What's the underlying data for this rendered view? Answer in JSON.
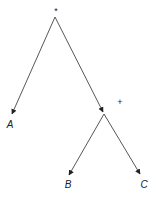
{
  "diagram": {
    "type": "expression-tree",
    "nodes": [
      {
        "id": "root",
        "label": "*",
        "kind": "operator",
        "x": 56,
        "y": 13
      },
      {
        "id": "plus",
        "label": "+",
        "kind": "operator",
        "x": 120,
        "y": 104
      },
      {
        "id": "A",
        "label": "A",
        "kind": "leaf",
        "x": 10,
        "y": 129
      },
      {
        "id": "B",
        "label": "B",
        "kind": "leaf",
        "x": 68,
        "y": 188
      },
      {
        "id": "C",
        "label": "C",
        "kind": "leaf",
        "x": 144,
        "y": 189
      }
    ],
    "edges": [
      {
        "from": "root",
        "to": "A"
      },
      {
        "from": "root",
        "to": "plus"
      },
      {
        "from": "plus",
        "to": "B"
      },
      {
        "from": "plus",
        "to": "C"
      }
    ],
    "colors": {
      "line": "#444444",
      "text": "#222222",
      "background": "#ffffff"
    }
  }
}
